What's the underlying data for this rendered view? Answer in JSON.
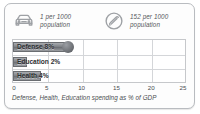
{
  "panel": {
    "accent_color": "#7f8287",
    "frame_color": "#b9bcc0",
    "grid_color": "#d4d6d9"
  },
  "stats": [
    {
      "icon": "car-icon",
      "value": "1",
      "line1": "1 per 1000",
      "line2": "population"
    },
    {
      "icon": "telephone-icon",
      "value": "152",
      "line1": "152 per 1000",
      "line2": "population"
    }
  ],
  "caption": "Defense, Health, Education spending as % of GDP",
  "chart_data": {
    "type": "bar",
    "orientation": "horizontal",
    "title": "",
    "subtitle": "",
    "categories": [
      "Defense",
      "Education",
      "Health"
    ],
    "values": [
      8,
      2,
      4
    ],
    "data_labels": [
      "Defense 8%",
      "Education 2%",
      "Health 4%"
    ],
    "xlabel": "Defense, Health, Education spending as % of GDP",
    "ylabel": "",
    "xlim": [
      0,
      25
    ],
    "xticks": [
      0,
      5,
      10,
      15,
      20,
      25
    ],
    "xtick_labels": [
      "0",
      "5",
      "10",
      "15",
      "20",
      "25"
    ],
    "grid": true,
    "legend": false,
    "series": [
      {
        "name": "spending as % of GDP",
        "values": [
          8,
          2,
          4
        ]
      }
    ]
  }
}
